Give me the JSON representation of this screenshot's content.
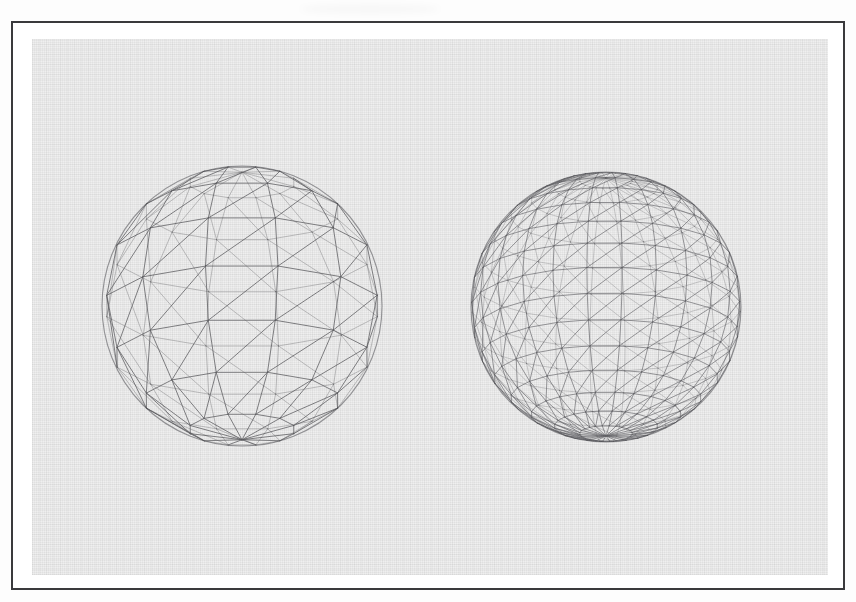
{
  "figure": {
    "title": "Wireframe sphere tessellation comparison",
    "frame": {
      "border_color": "#3a3a3c",
      "paper_color": "#ffffff",
      "canvas_color": "#efefef"
    },
    "line_color": "#58585c",
    "background_color": "#ffffff"
  },
  "chart_data": {
    "type": "scatter",
    "title": "Wireframe sphere tessellation comparison",
    "subtitle": "",
    "xlabel": "",
    "ylabel": "",
    "grid": false,
    "legend_position": "none",
    "annotations": [],
    "objects": [
      {
        "name": "coarse-sphere",
        "label": "Low resolution UV sphere wireframe",
        "center_x": 240,
        "center_y": 304,
        "radius": 140,
        "latitude_bands": 8,
        "meridians": 12,
        "triangulated": true,
        "edge_color": "#58585c",
        "edge_width": 0.85
      },
      {
        "name": "fine-sphere",
        "label": "High resolution UV sphere wireframe",
        "center_x": 604,
        "center_y": 305,
        "radius": 135,
        "latitude_bands": 16,
        "meridians": 24,
        "triangulated": true,
        "edge_color": "#5e5e62",
        "edge_width": 0.7
      }
    ],
    "categories": [
      "coarse",
      "fine"
    ],
    "values": [
      8,
      16
    ],
    "ylim": [
      0,
      16
    ]
  }
}
